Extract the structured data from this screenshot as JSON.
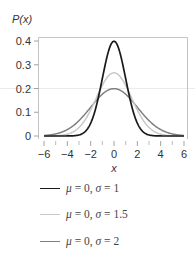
{
  "chart_data": {
    "type": "line",
    "title": "",
    "xlabel": "x",
    "ylabel": "P(x)",
    "xlim": [
      -6,
      6
    ],
    "ylim": [
      0,
      0.4
    ],
    "xticks": [
      -6,
      -4,
      -2,
      0,
      2,
      4,
      6
    ],
    "xtick_labels": [
      "−6",
      "−4",
      "−2",
      "0",
      "2",
      "4",
      "6"
    ],
    "xminor_ticks": [
      -5,
      -3,
      -1,
      1,
      3,
      5
    ],
    "yticks": [
      0,
      0.1,
      0.2,
      0.3,
      0.4
    ],
    "ytick_labels": [
      "0",
      "0.1",
      "0.2",
      "0.3",
      "0.4"
    ],
    "grid": false,
    "reference_line_y": 0.2,
    "legend_position": "below",
    "series": [
      {
        "name": "μ = 0, σ = 1",
        "mu": 0,
        "sigma": 1,
        "peak": 0.399,
        "color": "#1a1a1a",
        "width": 1.7,
        "x": [
          -6,
          -4,
          -3,
          -2,
          -1,
          0,
          1,
          2,
          3,
          4,
          6
        ],
        "values": [
          0.0,
          0.0001,
          0.0044,
          0.054,
          0.242,
          0.399,
          0.242,
          0.054,
          0.0044,
          0.0001,
          0.0
        ]
      },
      {
        "name": "μ = 0, σ = 1.5",
        "mu": 0,
        "sigma": 1.5,
        "peak": 0.266,
        "color": "#c8c8c8",
        "width": 1.5,
        "x": [
          -6,
          -4,
          -3,
          -2,
          -1,
          0,
          1,
          2,
          3,
          4,
          6
        ],
        "values": [
          0.0001,
          0.0076,
          0.036,
          0.109,
          0.213,
          0.266,
          0.213,
          0.109,
          0.036,
          0.0076,
          0.0001
        ]
      },
      {
        "name": "μ = 0, σ = 2",
        "mu": 0,
        "sigma": 2,
        "peak": 0.199,
        "color": "#808080",
        "width": 1.5,
        "x": [
          -6,
          -4,
          -3,
          -2,
          -1,
          0,
          1,
          2,
          3,
          4,
          6
        ],
        "values": [
          0.0022,
          0.027,
          0.065,
          0.121,
          0.176,
          0.199,
          0.176,
          0.121,
          0.065,
          0.027,
          0.0022
        ]
      }
    ]
  },
  "legend": {
    "items": [
      {
        "mu_sym": "μ",
        "eq1": " = 0, ",
        "sigma_sym": "σ",
        "eq2": " = 1",
        "color": "#1a1a1a"
      },
      {
        "mu_sym": "μ",
        "eq1": " = 0, ",
        "sigma_sym": "σ",
        "eq2": " = 1.5",
        "color": "#c8c8c8"
      },
      {
        "mu_sym": "μ",
        "eq1": " = 0, ",
        "sigma_sym": "σ",
        "eq2": " = 2",
        "color": "#808080"
      }
    ]
  }
}
